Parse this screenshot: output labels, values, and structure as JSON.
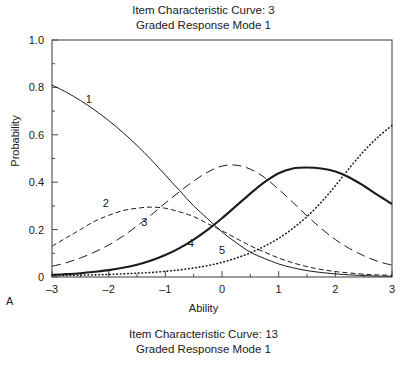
{
  "title": {
    "line1": "Item Characteristic Curve: 3",
    "line2": "Graded Response Mode 1"
  },
  "caption": {
    "line1": "Item Characteristic Curve: 13",
    "line2": "Graded Response Mode 1"
  },
  "panel_label": "A",
  "chart_data": {
    "type": "line",
    "xlabel": "Ability",
    "ylabel": "Probability",
    "xlim": [
      -3,
      3
    ],
    "ylim": [
      0,
      1.0
    ],
    "xticks": [
      "–3",
      "–2",
      "–1",
      "0",
      "1",
      "2",
      "3"
    ],
    "xtick_values": [
      -3,
      -2,
      -1,
      0,
      1,
      2,
      3
    ],
    "yticks": [
      "0",
      "0.2",
      "0.4",
      "0.6",
      "0.8",
      "1.0"
    ],
    "ytick_values": [
      0,
      0.2,
      0.4,
      0.6,
      0.8,
      1.0
    ],
    "minor_tick_step_x": 0.5,
    "minor_tick_step_y": 0.1,
    "grid": false,
    "legend": "inline-curve-labels",
    "frame": "box",
    "x": [
      -3,
      -2.75,
      -2.5,
      -2.25,
      -2,
      -1.75,
      -1.5,
      -1.25,
      -1,
      -0.75,
      -0.5,
      -0.25,
      0,
      0.25,
      0.5,
      0.75,
      1,
      1.25,
      1.5,
      1.75,
      2,
      2.25,
      2.5,
      2.75,
      3
    ],
    "series": [
      {
        "name": "1",
        "style": "thin-solid",
        "label_x": -2.35,
        "label_y": 0.735,
        "values": [
          0.81,
          0.78,
          0.745,
          0.705,
          0.66,
          0.61,
          0.555,
          0.495,
          0.43,
          0.365,
          0.3,
          0.245,
          0.19,
          0.145,
          0.105,
          0.078,
          0.055,
          0.039,
          0.027,
          0.019,
          0.013,
          0.009,
          0.006,
          0.004,
          0.003
        ]
      },
      {
        "name": "2",
        "style": "short-dash",
        "label_x": -2.05,
        "label_y": 0.295,
        "values": [
          0.13,
          0.165,
          0.2,
          0.235,
          0.26,
          0.28,
          0.29,
          0.295,
          0.29,
          0.275,
          0.255,
          0.225,
          0.195,
          0.163,
          0.132,
          0.105,
          0.08,
          0.06,
          0.044,
          0.032,
          0.023,
          0.017,
          0.012,
          0.009,
          0.007
        ]
      },
      {
        "name": "3",
        "style": "long-dash",
        "label_x": -1.37,
        "label_y": 0.215,
        "values": [
          0.045,
          0.06,
          0.08,
          0.105,
          0.135,
          0.172,
          0.215,
          0.262,
          0.312,
          0.36,
          0.405,
          0.443,
          0.468,
          0.472,
          0.455,
          0.42,
          0.37,
          0.315,
          0.258,
          0.205,
          0.158,
          0.12,
          0.09,
          0.066,
          0.05
        ]
      },
      {
        "name": "4",
        "style": "thick-solid",
        "label_x": -0.55,
        "label_y": 0.125,
        "values": [
          0.009,
          0.012,
          0.016,
          0.022,
          0.029,
          0.039,
          0.052,
          0.07,
          0.093,
          0.122,
          0.158,
          0.2,
          0.248,
          0.3,
          0.352,
          0.4,
          0.438,
          0.458,
          0.462,
          0.458,
          0.445,
          0.42,
          0.385,
          0.345,
          0.308
        ]
      },
      {
        "name": "5",
        "style": "dotted",
        "label_x": 0.0,
        "label_y": 0.095,
        "values": [
          0.006,
          0.007,
          0.008,
          0.009,
          0.011,
          0.013,
          0.016,
          0.019,
          0.024,
          0.03,
          0.038,
          0.048,
          0.062,
          0.08,
          0.102,
          0.13,
          0.163,
          0.205,
          0.255,
          0.315,
          0.385,
          0.46,
          0.53,
          0.59,
          0.64
        ]
      }
    ]
  }
}
